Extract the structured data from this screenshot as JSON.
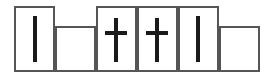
{
  "figure": {
    "type": "diagram",
    "canvas": {
      "width": 275,
      "height": 81,
      "background_color": "#ffffff"
    },
    "style": {
      "border_color": "#555555",
      "border_width": 2,
      "fill_color": "#ffffff",
      "mark_color": "#1a1a1a",
      "baseline_y": 72,
      "tall_top_y": 6,
      "short_top_y": 26
    },
    "cells": [
      {
        "index": 1,
        "name": "cell-1",
        "height_class": "tall",
        "x": 14,
        "y": 6,
        "width": 41,
        "height": 66,
        "mark": "vertical-bar",
        "mark_label": "|",
        "mark_x": 33,
        "mark_y": 16,
        "mark_width": 4,
        "mark_height": 46
      },
      {
        "index": 2,
        "name": "cell-2",
        "height_class": "short",
        "x": 55,
        "y": 26,
        "width": 41,
        "height": 46,
        "mark": "none",
        "mark_label": ""
      },
      {
        "index": 3,
        "name": "cell-3",
        "height_class": "tall",
        "x": 96,
        "y": 6,
        "width": 41,
        "height": 66,
        "mark": "cross",
        "mark_label": "+",
        "mark_x": 114,
        "mark_y": 18,
        "mark_width": 4,
        "mark_height": 44,
        "cross_arm_x": 105,
        "cross_arm_y": 31,
        "cross_arm_width": 22,
        "cross_arm_height": 4
      },
      {
        "index": 4,
        "name": "cell-4",
        "height_class": "tall",
        "x": 137,
        "y": 6,
        "width": 41,
        "height": 66,
        "mark": "cross",
        "mark_label": "+",
        "mark_x": 155,
        "mark_y": 18,
        "mark_width": 4,
        "mark_height": 44,
        "cross_arm_x": 146,
        "cross_arm_y": 31,
        "cross_arm_width": 22,
        "cross_arm_height": 4
      },
      {
        "index": 5,
        "name": "cell-5",
        "height_class": "tall",
        "x": 178,
        "y": 6,
        "width": 41,
        "height": 66,
        "mark": "vertical-bar",
        "mark_label": "|",
        "mark_x": 196,
        "mark_y": 16,
        "mark_width": 4,
        "mark_height": 46
      },
      {
        "index": 6,
        "name": "cell-6",
        "height_class": "short",
        "x": 219,
        "y": 26,
        "width": 41,
        "height": 46,
        "mark": "none",
        "mark_label": ""
      }
    ]
  }
}
